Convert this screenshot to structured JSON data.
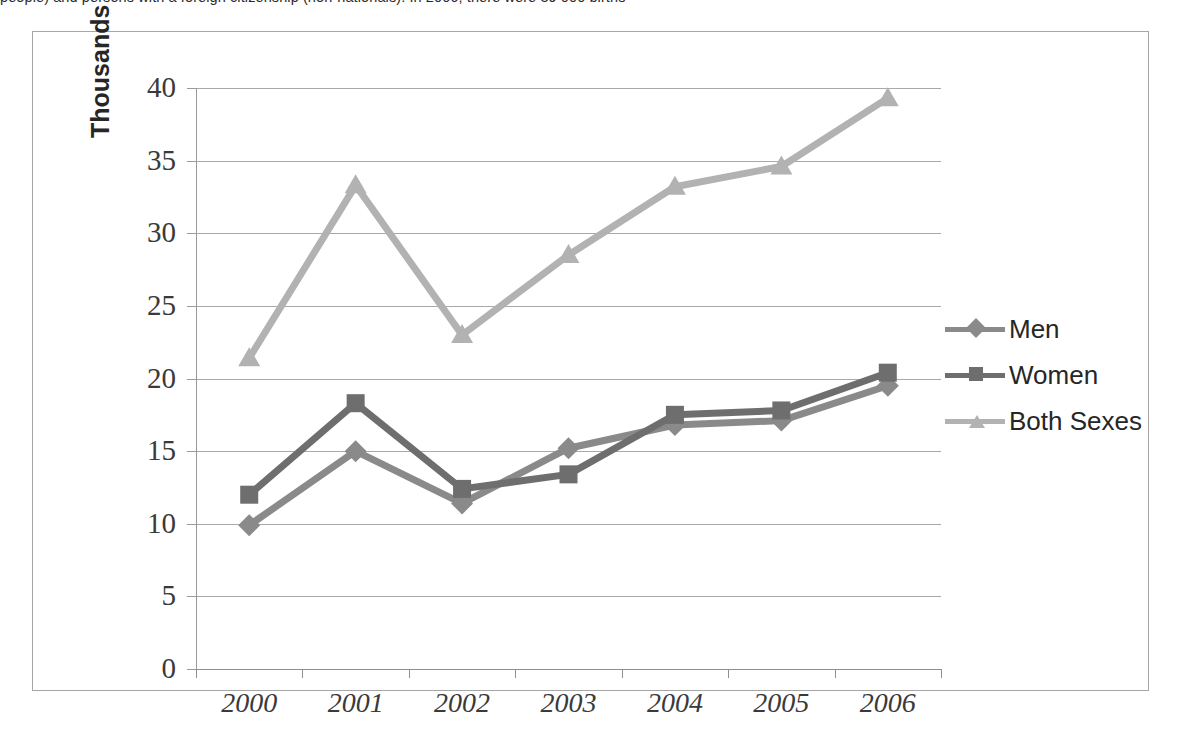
{
  "top_caption": "people) and persons with a foreign citizenship (non-nationals). In 2006, there were 39 000 births",
  "chart_data": {
    "type": "line",
    "title": "",
    "subtitle": "",
    "xlabel": "",
    "ylabel": "Thousands",
    "categories": [
      "2000",
      "2001",
      "2002",
      "2003",
      "2004",
      "2005",
      "2006"
    ],
    "x": [
      2000,
      2001,
      2002,
      2003,
      2004,
      2005,
      2006
    ],
    "ylim": [
      0,
      40
    ],
    "ytick_values": [
      0,
      5,
      10,
      15,
      20,
      25,
      30,
      35,
      40
    ],
    "ytick_labels": [
      "0",
      "5",
      "10",
      "15",
      "20",
      "25",
      "30",
      "35",
      "40"
    ],
    "grid": true,
    "legend_position": "right",
    "series": [
      {
        "name": "Men",
        "marker": "diamond",
        "color": "#8a8a8a",
        "values": [
          9.9,
          15.0,
          11.4,
          15.2,
          16.8,
          17.1,
          19.5
        ]
      },
      {
        "name": "Women",
        "marker": "square",
        "color": "#6e6e6e",
        "values": [
          12.0,
          18.3,
          12.4,
          13.4,
          17.5,
          17.8,
          20.4
        ]
      },
      {
        "name": "Both Sexes",
        "marker": "triangle",
        "color": "#b2b2b2",
        "values": [
          21.4,
          33.3,
          23.0,
          28.5,
          33.2,
          34.6,
          39.3
        ]
      }
    ]
  },
  "legend": {
    "items": [
      {
        "label": "Men"
      },
      {
        "label": "Women"
      },
      {
        "label": "Both Sexes"
      }
    ]
  },
  "colors": {
    "men": "#8a8a8a",
    "women": "#6e6e6e",
    "both": "#b2b2b2",
    "grid": "#a9a9a9",
    "axis": "#8f8f8f",
    "frame": "#a6a6a6",
    "text": "#3a3a3a"
  }
}
